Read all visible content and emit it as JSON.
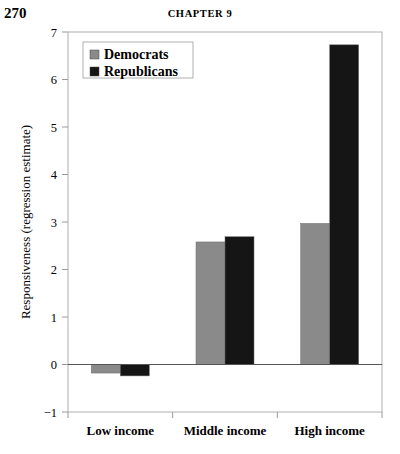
{
  "page": {
    "number": "270",
    "running_head": "CHAPTER 9"
  },
  "chart_data": {
    "type": "bar",
    "title": "",
    "xlabel": "",
    "ylabel": "Responsiveness (regression estimate)",
    "categories": [
      "Low income",
      "Middle income",
      "High income"
    ],
    "series": [
      {
        "name": "Democrats",
        "color": "#8a8a8a",
        "values": [
          -0.18,
          2.58,
          2.97
        ]
      },
      {
        "name": "Republicans",
        "color": "#151515",
        "values": [
          -0.24,
          2.69,
          6.73
        ]
      }
    ],
    "ylim": [
      -1,
      7
    ],
    "yticks": [
      -1,
      0,
      1,
      2,
      3,
      4,
      5,
      6,
      7
    ],
    "ytick_labels": [
      "−1",
      "0",
      "1",
      "2",
      "3",
      "4",
      "5",
      "6",
      "7"
    ],
    "grid": false,
    "zero_line": true,
    "legend_position": "top-left",
    "legend_entries": [
      "Democrats",
      "Republicans"
    ],
    "frame_color": "#b0b0b0"
  }
}
